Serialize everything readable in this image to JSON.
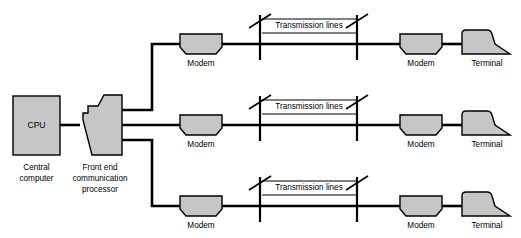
{
  "diagram": {
    "colors": {
      "shape_fill": "#c6c6c6",
      "outline": "#000000",
      "wire": "#000000",
      "background": "#ffffff"
    },
    "nodes": {
      "cpu": {
        "inner_label": "CPU",
        "caption_line1": "Central",
        "caption_line2": "computer"
      },
      "front_end": {
        "caption_line1": "Front end",
        "caption_line2": "communication",
        "caption_line3": "processor"
      },
      "modem_label": "Modem",
      "terminal_label": "Terminal",
      "transmission_label": "Transmission lines"
    },
    "rows": [
      {
        "id": "row-top",
        "left_modem": "Modem",
        "transmission": "Transmission lines",
        "right_modem": "Modem",
        "terminal": "Terminal"
      },
      {
        "id": "row-middle",
        "left_modem": "Modem",
        "transmission": "Transmission lines",
        "right_modem": "Modem",
        "terminal": "Terminal"
      },
      {
        "id": "row-bottom",
        "left_modem": "Modem",
        "transmission": "Transmission lines",
        "right_modem": "Modem",
        "terminal": "Terminal"
      }
    ]
  }
}
